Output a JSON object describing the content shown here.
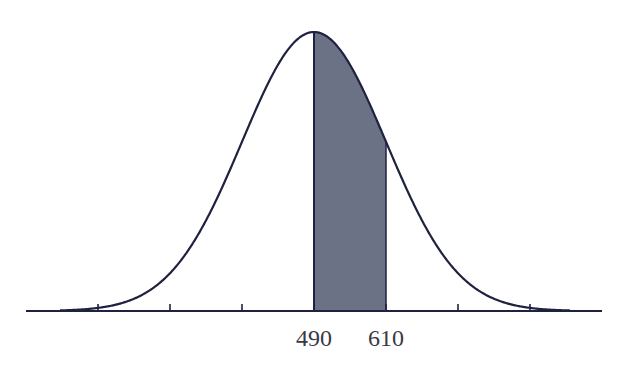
{
  "chart_data": {
    "type": "area",
    "title": "",
    "distribution": "normal",
    "mean": 490,
    "sd": 120,
    "shaded_region": {
      "from": 490,
      "to": 610
    },
    "tick_count": 7,
    "tick_values_implied": [
      130,
      250,
      370,
      490,
      610,
      730,
      850
    ],
    "tick_labels": [
      {
        "value": 490,
        "text": "490"
      },
      {
        "value": 610,
        "text": "610"
      }
    ],
    "xlabel": "",
    "ylabel": "",
    "grid": false,
    "legend": null
  },
  "colors": {
    "curve": "#1f2140",
    "shade": "#6b7285",
    "axis": "#1f2140",
    "label": "#3a3a44"
  },
  "geometry": {
    "axis_y": 311,
    "axis_x_start": 26,
    "axis_x_end": 602,
    "mean_x": 314,
    "sd_px": 72,
    "peak_y": 32,
    "tick_xs": [
      98,
      170,
      242,
      314,
      386,
      458,
      530
    ]
  }
}
